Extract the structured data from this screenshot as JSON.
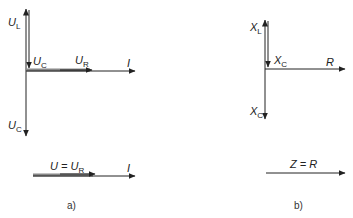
{
  "panel_a": {
    "caption": "a)",
    "labels": {
      "UL": {
        "main": "U",
        "sub": "L"
      },
      "UC_top": {
        "main": "U",
        "sub": "C"
      },
      "UR": {
        "main": "U",
        "sub": "R"
      },
      "I": {
        "main": "I"
      },
      "UC_bottom": {
        "main": "U",
        "sub": "C"
      },
      "result_U": {
        "main": "U = U",
        "sub": "R"
      },
      "result_I": {
        "main": "I"
      }
    }
  },
  "panel_b": {
    "caption": "b)",
    "labels": {
      "XL": {
        "main": "X",
        "sub": "L"
      },
      "XC_top": {
        "main": "X",
        "sub": "C"
      },
      "R": {
        "main": "R"
      },
      "XC_bottom": {
        "main": "X",
        "sub": "C"
      },
      "result_Z": {
        "main": "Z = R"
      }
    }
  },
  "colors": {
    "line": "#222222",
    "thick_line": "#777777"
  }
}
